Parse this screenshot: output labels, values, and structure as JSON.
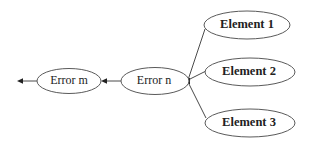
{
  "diagram": {
    "type": "cause-effect graph",
    "nodes": [
      {
        "id": "error_m",
        "label": "Error m",
        "bold": false,
        "cx": 69,
        "cy": 81,
        "rx": 32,
        "ry": 12.5
      },
      {
        "id": "error_n",
        "label": "Error n",
        "bold": false,
        "cx": 155,
        "cy": 81,
        "rx": 34,
        "ry": 13.5
      },
      {
        "id": "element_1",
        "label": "Element 1",
        "bold": true,
        "cx": 247,
        "cy": 25,
        "rx": 43,
        "ry": 14
      },
      {
        "id": "element_2",
        "label": "Element 2",
        "bold": true,
        "cx": 250,
        "cy": 72,
        "rx": 45,
        "ry": 14
      },
      {
        "id": "element_3",
        "label": "Element 3",
        "bold": true,
        "cx": 250,
        "cy": 123,
        "rx": 45,
        "ry": 14
      }
    ],
    "edges": [
      {
        "from": "element_1",
        "to": "error_n",
        "x1": 205,
        "y1": 29,
        "x2": 188,
        "y2": 80,
        "arrow": false
      },
      {
        "from": "element_2",
        "to": "error_n",
        "x1": 206,
        "y1": 71,
        "x2": 188,
        "y2": 80,
        "arrow": false
      },
      {
        "from": "element_3",
        "to": "error_n",
        "x1": 206,
        "y1": 118,
        "x2": 188,
        "y2": 82,
        "arrow": false
      },
      {
        "from": "error_n",
        "to": "error_m",
        "x1": 121,
        "y1": 81,
        "x2": 102,
        "y2": 81,
        "arrow": true
      },
      {
        "from": "error_m",
        "to": "outside",
        "x1": 37,
        "y1": 81,
        "x2": 18,
        "y2": 81,
        "arrow": true
      }
    ],
    "junction": {
      "cx": 188,
      "cy": 81
    },
    "colors": {
      "stroke": "#5a5a5a",
      "text": "#222222",
      "background": "#ffffff"
    }
  }
}
